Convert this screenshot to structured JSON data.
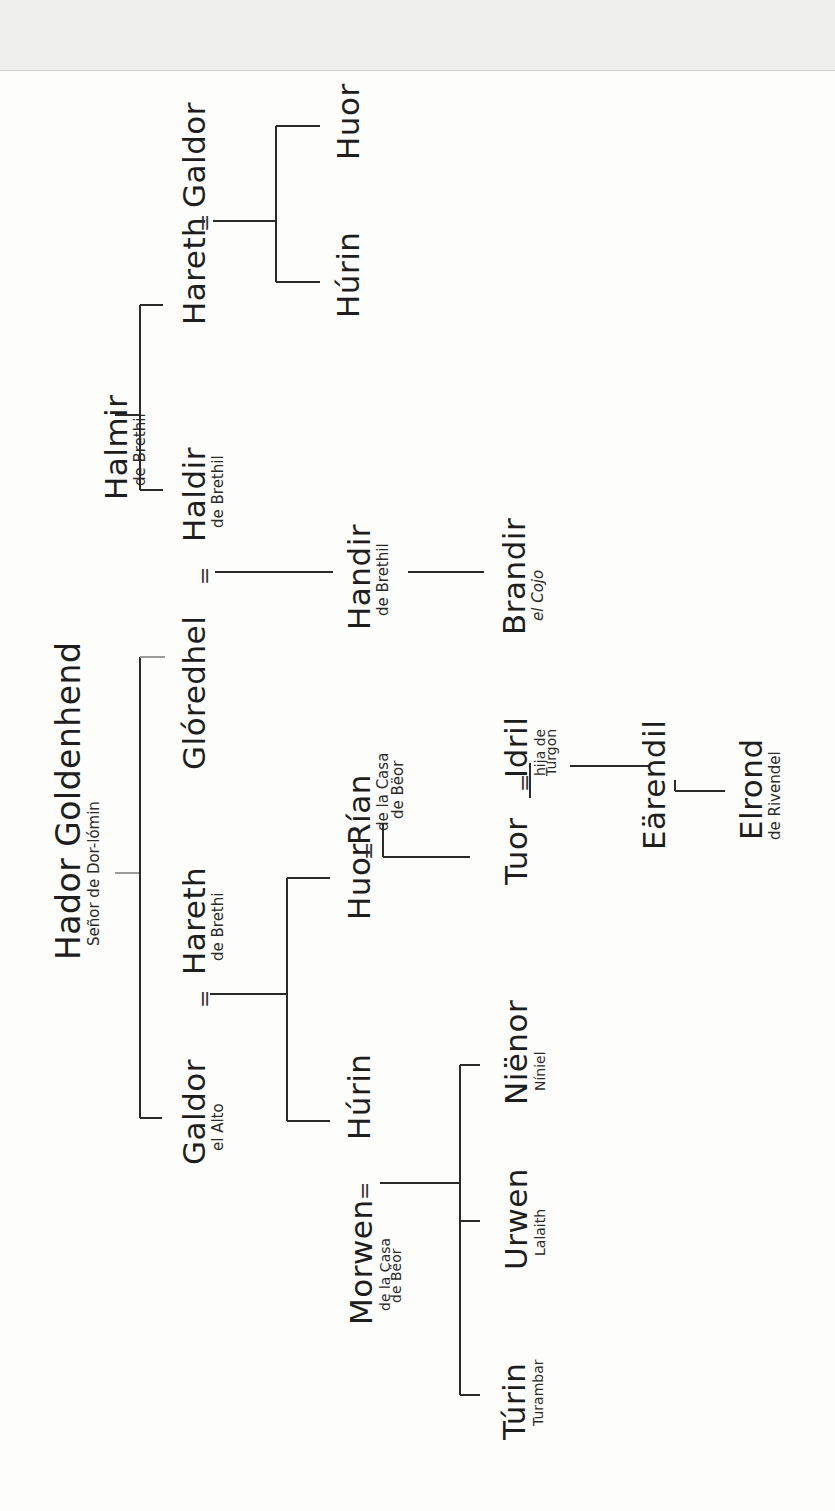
{
  "diagram": {
    "type": "family-tree",
    "orientation": "rotated-90-ccw",
    "colors": {
      "line": "#2a2a2a",
      "text": "#1e1e1e",
      "background": "#fdfdfc",
      "top_band": "#efefed"
    },
    "marriage_symbol": "=",
    "people": {
      "hador": {
        "name": "Hador Goldenhend",
        "sub": "Señor de Dor-lómin"
      },
      "galdor_alto": {
        "name": "Galdor",
        "sub": "el Alto"
      },
      "hareth_brethil": {
        "name": "Hareth",
        "sub": "de Brethi"
      },
      "gloredhel": {
        "name": "Glóredhel"
      },
      "haldir": {
        "name": "Haldir",
        "sub": "de Brethil"
      },
      "halmir": {
        "name": "Halmir",
        "sub": "de Brethil"
      },
      "hareth2": {
        "name": "Hareth"
      },
      "galdor2": {
        "name": "Galdor"
      },
      "hurin_top": {
        "name": "Húrin"
      },
      "huor_top": {
        "name": "Huor"
      },
      "handir": {
        "name": "Handir",
        "sub": "de Brethil"
      },
      "brandir": {
        "name": "Brandir",
        "sub": "el Cojo"
      },
      "hurin": {
        "name": "Húrin"
      },
      "huor": {
        "name": "Huor"
      },
      "rian": {
        "name": "Rían",
        "sub1": "de la Casa",
        "sub2": "de Bëor"
      },
      "morwen": {
        "name": "Morwen",
        "sub1": "de la Casa",
        "sub2": "de Bëor"
      },
      "turin": {
        "name": "Túrin",
        "sub": "Turambar"
      },
      "urwen": {
        "name": "Urwen",
        "sub": "Lalaith"
      },
      "nienor": {
        "name": "Niënor",
        "sub": "Níniel"
      },
      "tuor": {
        "name": "Tuor"
      },
      "idril": {
        "name": "Idril",
        "sub1": "hija de",
        "sub2": "Turgon"
      },
      "earendil": {
        "name": "Eärendil"
      },
      "elrond": {
        "name": "Elrond",
        "sub": "de Rivendel"
      }
    },
    "relations": [
      {
        "type": "children",
        "parent": "Hador Goldenhend",
        "children": [
          "Galdor",
          "Glóredhel"
        ]
      },
      {
        "type": "marriage",
        "a": "Galdor",
        "b": "Hareth"
      },
      {
        "type": "children",
        "parents": [
          "Galdor",
          "Hareth"
        ],
        "children": [
          "Húrin",
          "Huor"
        ]
      },
      {
        "type": "marriage",
        "a": "Glóredhel",
        "b": "Haldir"
      },
      {
        "type": "children",
        "parent": "Halmir",
        "children": [
          "Haldir",
          "Hareth"
        ]
      },
      {
        "type": "marriage",
        "a": "Hareth",
        "b": "Galdor"
      },
      {
        "type": "children",
        "parents": [
          "Hareth",
          "Galdor"
        ],
        "children": [
          "Húrin",
          "Huor"
        ]
      },
      {
        "type": "children",
        "parents": [
          "Glóredhel",
          "Haldir"
        ],
        "children": [
          "Handir"
        ]
      },
      {
        "type": "children",
        "parent": "Handir",
        "children": [
          "Brandir"
        ]
      },
      {
        "type": "marriage",
        "a": "Huor",
        "b": "Rían"
      },
      {
        "type": "children",
        "parents": [
          "Huor",
          "Rían"
        ],
        "children": [
          "Tuor"
        ]
      },
      {
        "type": "marriage",
        "a": "Húrin",
        "b": "Morwen"
      },
      {
        "type": "children",
        "parents": [
          "Húrin",
          "Morwen"
        ],
        "children": [
          "Túrin",
          "Urwen",
          "Niënor"
        ]
      },
      {
        "type": "marriage",
        "a": "Tuor",
        "b": "Idril"
      },
      {
        "type": "children",
        "parents": [
          "Tuor",
          "Idril"
        ],
        "children": [
          "Eärendil"
        ]
      },
      {
        "type": "children",
        "parent": "Eärendil",
        "children": [
          "Elrond"
        ]
      }
    ]
  }
}
